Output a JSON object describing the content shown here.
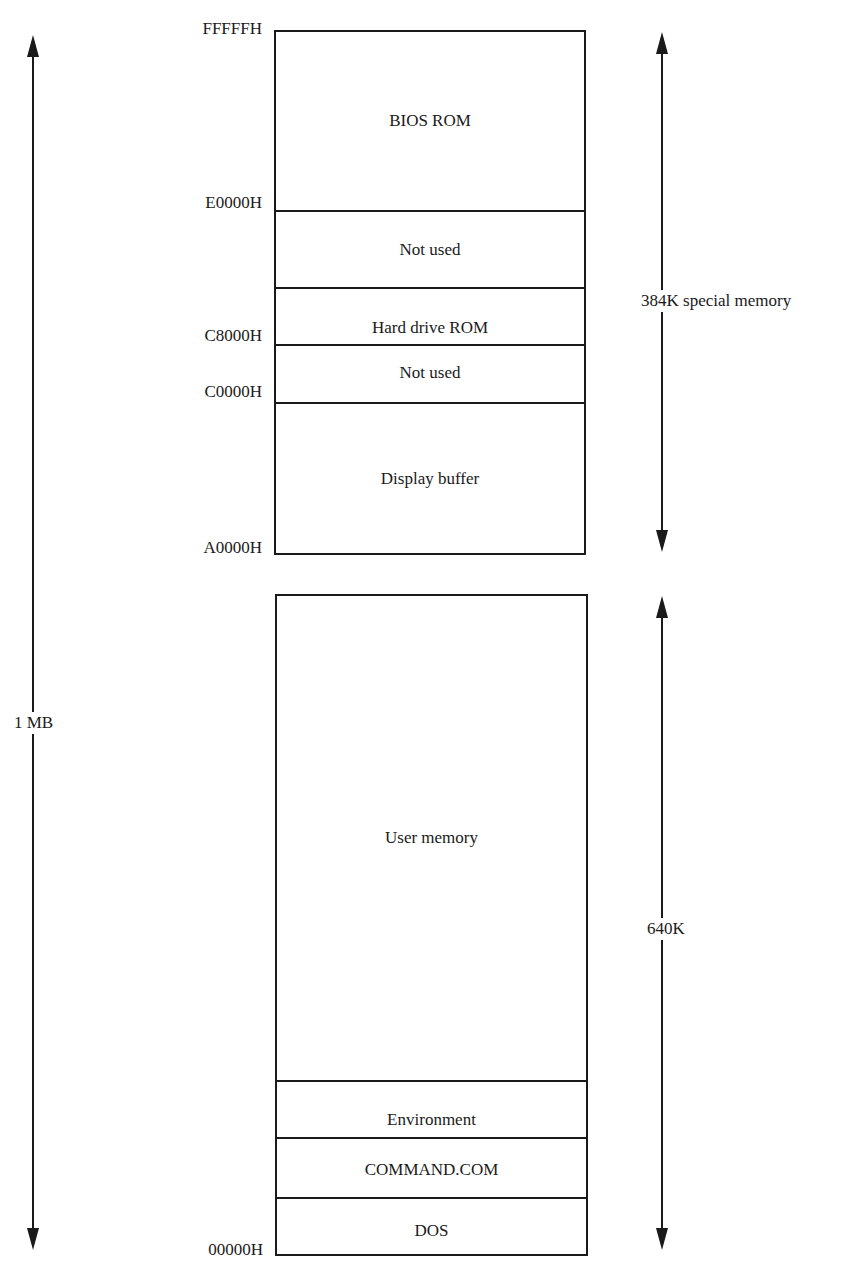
{
  "diagram": {
    "special_block": {
      "regions": [
        {
          "label": "BIOS ROM"
        },
        {
          "label": "Not used"
        },
        {
          "label": "Hard drive ROM"
        },
        {
          "label": "Not used"
        },
        {
          "label": "Display buffer"
        }
      ]
    },
    "user_block": {
      "regions": [
        {
          "label": "User memory"
        },
        {
          "label": "Environment"
        },
        {
          "label": "COMMAND.COM"
        },
        {
          "label": "DOS"
        }
      ]
    },
    "addresses": [
      {
        "label": "FFFFFH"
      },
      {
        "label": "E0000H"
      },
      {
        "label": "C8000H"
      },
      {
        "label": "C0000H"
      },
      {
        "label": "A0000H"
      },
      {
        "label": "00000H"
      }
    ],
    "dimensions": {
      "total": "1 MB",
      "special": "384K special memory",
      "conventional": "640K"
    }
  }
}
